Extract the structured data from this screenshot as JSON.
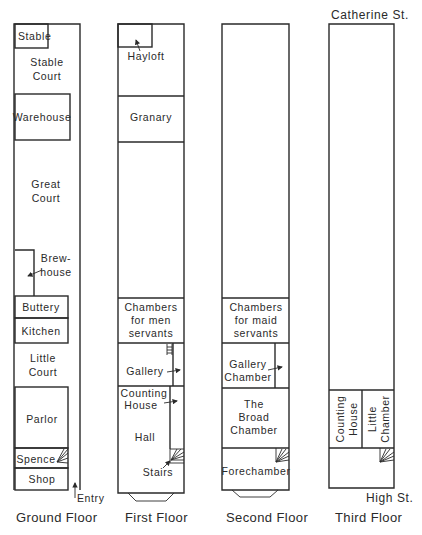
{
  "streets": {
    "north": "Catherine St.",
    "south": "High St."
  },
  "floors": [
    {
      "caption": "Ground Floor",
      "rooms": {
        "stable": "Stable",
        "stable_court": [
          "Stable",
          "Court"
        ],
        "warehouse": "Warehouse",
        "great_court": [
          "Great",
          "Court"
        ],
        "brewhouse": [
          "Brew-",
          "house"
        ],
        "buttery": "Buttery",
        "kitchen": "Kitchen",
        "little_court": [
          "Little",
          "Court"
        ],
        "parlor": "Parlor",
        "spence": "Spence",
        "shop": "Shop"
      },
      "entry": "Entry"
    },
    {
      "caption": "First Floor",
      "rooms": {
        "hayloft": "Hayloft",
        "granary": "Granary",
        "chambers_men": [
          "Chambers",
          "for men",
          "servants"
        ],
        "gallery": "Gallery",
        "counting_house": [
          "Counting",
          "House"
        ],
        "hall": "Hall",
        "stairs": "Stairs"
      }
    },
    {
      "caption": "Second Floor",
      "rooms": {
        "chambers_maid": [
          "Chambers",
          "for maid",
          "servants"
        ],
        "gallery_chamber": [
          "Gallery",
          "Chamber"
        ],
        "broad_chamber": [
          "The",
          "Broad",
          "Chamber"
        ],
        "forechamber": "Forechamber"
      }
    },
    {
      "caption": "Third Floor",
      "rooms": {
        "counting_house": [
          "Counting",
          "House"
        ],
        "little_chamber": [
          "Little",
          "Chamber"
        ]
      }
    }
  ]
}
